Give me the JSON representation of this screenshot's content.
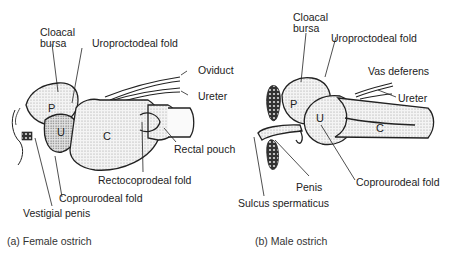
{
  "figure": {
    "panels": [
      {
        "id": "a",
        "caption": "(a) Female ostrich",
        "labels": {
          "cloacal_bursa_1": "Cloacal",
          "cloacal_bursa_2": "bursa",
          "uroproctodeal_fold": "Uroproctodeal fold",
          "oviduct": "Oviduct",
          "ureter": "Ureter",
          "rectal_pouch": "Rectal pouch",
          "rectocoprodeal_fold": "Rectocoprodeal fold",
          "coprourodeal_fold": "Coprourodeal fold",
          "vestigial_penis": "Vestigial penis"
        },
        "regions": {
          "p": "P",
          "u": "U",
          "c": "C"
        }
      },
      {
        "id": "b",
        "caption": "(b) Male ostrich",
        "labels": {
          "cloacal_bursa_1": "Cloacal",
          "cloacal_bursa_2": "bursa",
          "uroproctodeal_fold": "Uroproctodeal fold",
          "vas_deferens": "Vas deferens",
          "ureter": "Ureter",
          "penis": "Penis",
          "coprourodeal_fold": "Coprourodeal fold",
          "sulcus_spermaticus": "Sulcus spermaticus"
        },
        "regions": {
          "p": "P",
          "u": "U",
          "c": "C"
        }
      }
    ]
  }
}
